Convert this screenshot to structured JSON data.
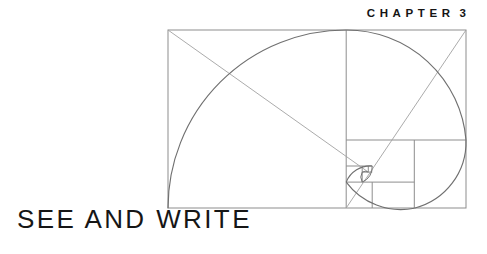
{
  "page": {
    "width": 487,
    "height": 254,
    "background_color": "#ffffff"
  },
  "header": {
    "eyebrow_word": "CHAPTER",
    "eyebrow_number": "3",
    "eyebrow_full": "CHAPTER 3",
    "eyebrow_color": "#151515"
  },
  "title": {
    "text": "SEE AND WRITE",
    "color": "#161616"
  },
  "figure": {
    "name": "golden-ratio-spiral-diagram",
    "stroke_color": "#8a8a8a",
    "diagonal_color": "#a0a0a0",
    "spiral_color": "#6f6f6f",
    "rect": {
      "x": 168,
      "y": 30,
      "width": 298,
      "height": 178
    },
    "ratio": 1.618,
    "squares": [
      {
        "index": 1,
        "x": 168,
        "y": 30,
        "size": 178
      },
      {
        "index": 2,
        "x": 346,
        "y": 30,
        "size": 110
      },
      {
        "index": 3,
        "x": 346,
        "y": 140,
        "size": 68
      },
      {
        "index": 4,
        "x": 394,
        "y": 140,
        "size": 42
      },
      {
        "index": 5,
        "x": 394,
        "y": 182,
        "size": 26
      },
      {
        "index": 6,
        "x": 378,
        "y": 182,
        "size": 16
      },
      {
        "index": 7,
        "x": 378,
        "y": 172,
        "size": 10
      },
      {
        "index": 8,
        "x": 384,
        "y": 172,
        "size": 6
      }
    ],
    "spiral_arcs": 8,
    "diagonals": [
      {
        "from": "top-left",
        "to": "spiral-pole"
      },
      {
        "from": "top-right",
        "to": "spiral-pole"
      }
    ]
  }
}
